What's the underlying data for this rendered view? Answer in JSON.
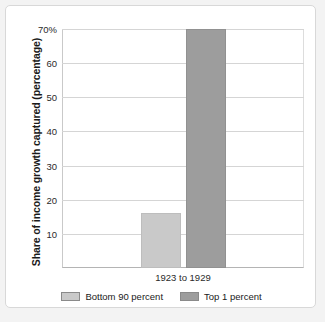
{
  "chart_data": {
    "type": "bar",
    "title": "",
    "subtitle": "",
    "xlabel": "",
    "ylabel": "Share of income growth captured (percentage)",
    "categories": [
      "1923 to 1929"
    ],
    "series": [
      {
        "name": "Bottom 90 percent",
        "values": [
          16
        ],
        "color": "#c9c9c9"
      },
      {
        "name": "Top 1 percent",
        "values": [
          70
        ],
        "color": "#9d9d9d"
      }
    ],
    "ylim": [
      0,
      70
    ],
    "yticks": [
      10,
      20,
      30,
      40,
      50,
      60,
      70
    ],
    "ytick_labels": [
      "10",
      "20",
      "30",
      "40",
      "50",
      "60",
      "70%"
    ],
    "grid": true,
    "legend_position": "bottom",
    "background_color": "#ffffff",
    "gridline_color": "#d5d5d5"
  }
}
